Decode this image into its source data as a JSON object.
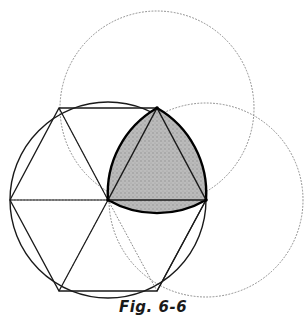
{
  "figure": {
    "caption": "Fig. 6-6"
  },
  "colors": {
    "background": "#ffffff",
    "stroke_solid": "#1a1a1a",
    "stroke_bold": "#000000",
    "stroke_dotted": "#8a8a8a",
    "shade_fill": "#b4b4b4",
    "caption_text": "#1a1a1a"
  },
  "chart_data": {
    "type": "diagram",
    "title": "Fig. 6-6",
    "xlim": [
      0,
      306
    ],
    "ylim": [
      0,
      327
    ],
    "grid": false,
    "legend": null,
    "origin": {
      "label": "center",
      "x": 108,
      "y": 200
    },
    "radius": 98,
    "circles": [
      {
        "name": "main-circle",
        "cx": 108,
        "cy": 200,
        "r": 98,
        "style": "solid",
        "width": 1.4
      },
      {
        "name": "upper-dotted-circle",
        "cx": 157,
        "cy": 108,
        "r": 97,
        "style": "dotted",
        "width": 1.0
      },
      {
        "name": "right-dotted-circle",
        "cx": 206,
        "cy": 200,
        "r": 97,
        "style": "dotted",
        "width": 1.0
      }
    ],
    "hexagon": {
      "name": "inscribed-hexagon",
      "vertices": [
        {
          "label": "E",
          "x": 206,
          "y": 200
        },
        {
          "label": "A",
          "x": 157,
          "y": 108
        },
        {
          "label": "B",
          "x": 59,
          "y": 108
        },
        {
          "label": "C",
          "x": 10,
          "y": 200
        },
        {
          "label": "D",
          "x": 59,
          "y": 291
        },
        {
          "label": "F",
          "x": 157,
          "y": 291
        }
      ]
    },
    "spokes": {
      "name": "hexagon-radii",
      "from": {
        "x": 108,
        "y": 200
      },
      "to": [
        {
          "x": 206,
          "y": 200
        },
        {
          "x": 157,
          "y": 108
        },
        {
          "x": 59,
          "y": 108
        },
        {
          "x": 10,
          "y": 200
        },
        {
          "x": 59,
          "y": 291
        },
        {
          "x": 157,
          "y": 291
        }
      ]
    },
    "reuleaux_triangle": {
      "name": "shaded-reuleaux-triangle",
      "vertices": [
        {
          "label": "O",
          "x": 108,
          "y": 200
        },
        {
          "label": "A",
          "x": 157,
          "y": 108
        },
        {
          "label": "E",
          "x": 206,
          "y": 200
        }
      ],
      "arc_radius": 98,
      "fill": "#b4b4b4",
      "stroke_width": 2.4
    },
    "inner_triangle": {
      "name": "inner-straight-triangle",
      "vertices": [
        {
          "x": 108,
          "y": 200
        },
        {
          "x": 157,
          "y": 108
        },
        {
          "x": 206,
          "y": 200
        }
      ]
    }
  }
}
